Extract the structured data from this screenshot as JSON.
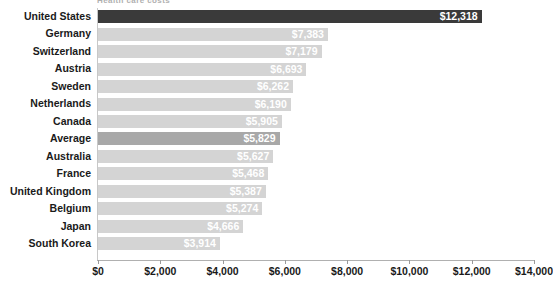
{
  "chart_data": {
    "type": "bar",
    "orientation": "horizontal",
    "title": "Health care costs",
    "xlabel": "",
    "ylabel": "",
    "xlim": [
      0,
      14000
    ],
    "xticks": [
      0,
      2000,
      4000,
      6000,
      8000,
      10000,
      12000,
      14000
    ],
    "xtick_labels": [
      "$0",
      "$2,000",
      "$4,000",
      "$6,000",
      "$8,000",
      "$10,000",
      "$12,000",
      "$14,000"
    ],
    "grid": false,
    "legend": "none",
    "categories": [
      "United States",
      "Germany",
      "Switzerland",
      "Austria",
      "Sweden",
      "Netherlands",
      "Canada",
      "Average",
      "Australia",
      "France",
      "United Kingdom",
      "Belgium",
      "Japan",
      "South Korea"
    ],
    "values": [
      12318,
      7383,
      7179,
      6693,
      6262,
      6190,
      5905,
      5829,
      5627,
      5468,
      5387,
      5274,
      4666,
      3914
    ],
    "value_labels": [
      "$12,318",
      "$7,383",
      "$7,179",
      "$6,693",
      "$6,262",
      "$6,190",
      "$5,905",
      "$5,829",
      "$5,627",
      "$5,468",
      "$5,387",
      "$5,274",
      "$4,666",
      "$3,914"
    ],
    "bar_styles": [
      "highlight",
      "normal",
      "normal",
      "normal",
      "normal",
      "normal",
      "normal",
      "accent",
      "normal",
      "normal",
      "normal",
      "normal",
      "normal",
      "normal"
    ],
    "colors": {
      "bar": "#d4d4d4",
      "bar_accent": "#a8a8a8",
      "bar_highlight": "#3a3a3a",
      "value_text": "#ffffff",
      "axis": "#b0b0b0",
      "label_text": "#1a1a1a"
    }
  }
}
